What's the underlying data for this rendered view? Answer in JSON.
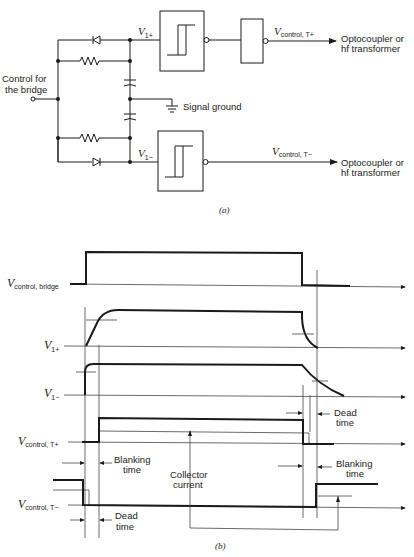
{
  "circuit": {
    "input_label_line1": "Control for",
    "input_label_line2": "the bridge",
    "v1plus": {
      "main": "V",
      "sub": "1+"
    },
    "v1minus": {
      "main": "V",
      "sub": "1−"
    },
    "signal_ground": "Signal ground",
    "vcontrol_tplus": {
      "main": "V",
      "sub": "control, T+"
    },
    "vcontrol_tminus": {
      "main": "V",
      "sub": "control, T−"
    },
    "output_top_line1": "Optocoupler or",
    "output_top_line2": "hf transformer",
    "output_bottom_line1": "Optocoupler or",
    "output_bottom_line2": "hf transformer",
    "caption": "(a)"
  },
  "timing": {
    "waveforms": [
      {
        "id": "vcontrol-bridge",
        "main": "V",
        "sub": "control, bridge"
      },
      {
        "id": "v1plus",
        "main": "V",
        "sub": "1+"
      },
      {
        "id": "v1minus",
        "main": "V",
        "sub": "1−"
      },
      {
        "id": "vcontrol-tplus",
        "main": "V",
        "sub": "control, T+"
      },
      {
        "id": "vcontrol-tminus",
        "main": "V",
        "sub": "control, T−"
      }
    ],
    "annotations": {
      "dead_time_top_1": "Dead",
      "dead_time_top_2": "time",
      "blanking_left_1": "Blanking",
      "blanking_left_2": "time",
      "collector_1": "Collector",
      "collector_2": "current",
      "blanking_right_1": "Blanking",
      "blanking_right_2": "time",
      "dead_time_bottom_1": "Dead",
      "dead_time_bottom_2": "time"
    },
    "caption": "(b)"
  }
}
